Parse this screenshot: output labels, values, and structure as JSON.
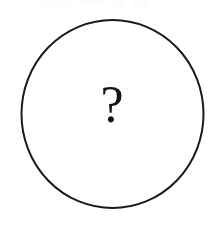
{
  "figure": {
    "type": "circle-with-question-mark",
    "background_color": "#ffffff",
    "canvas": {
      "width": 224,
      "height": 226
    },
    "circle": {
      "label": "circle-outline",
      "stroke_color": "#1a1a1a",
      "fill_color": "none",
      "stroke_width": 2,
      "center_x": 112.5,
      "center_y": 114,
      "radius_x": 91,
      "radius_y": 94
    },
    "question_mark": {
      "label": "question-mark",
      "text": "?",
      "color": "#141414",
      "center_x": 112,
      "center_y": 112,
      "font_size": 52,
      "top": 93,
      "bottom": 131
    }
  }
}
